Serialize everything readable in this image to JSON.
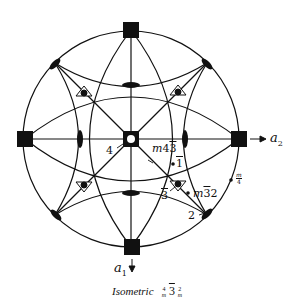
{
  "diagram": {
    "type": "stereographic-projection",
    "projection_circle": {
      "cx": 131,
      "cy": 139,
      "r": 108
    },
    "colors": {
      "ink": "#111111",
      "background": "#ffffff"
    },
    "axes": {
      "a1": {
        "label": "a",
        "subscript": "1",
        "direction": "down"
      },
      "a2": {
        "label": "a",
        "subscript": "2",
        "direction": "right"
      }
    },
    "symmetry_elements": {
      "fourfold_axes": [
        {
          "x": 131,
          "y": 30,
          "position": "top"
        },
        {
          "x": 25,
          "y": 139,
          "position": "left"
        },
        {
          "x": 239,
          "y": 139,
          "position": "right"
        },
        {
          "x": 132,
          "y": 247,
          "position": "bottom"
        }
      ],
      "fourfold_inversion_center": {
        "x": 131,
        "y": 139
      },
      "threefold_axes": [
        {
          "x": 84,
          "y": 92
        },
        {
          "x": 178,
          "y": 91
        },
        {
          "x": 84,
          "y": 186
        },
        {
          "x": 178,
          "y": 185
        }
      ],
      "twofold_axes_rim": [
        {
          "x": 55,
          "y": 63,
          "angle": -45
        },
        {
          "x": 207,
          "y": 63,
          "angle": 45
        },
        {
          "x": 55,
          "y": 215,
          "angle": 45
        },
        {
          "x": 207,
          "y": 215,
          "angle": -45
        }
      ],
      "twofold_axes_inner": [
        {
          "x": 131,
          "y": 85,
          "orient": "horizontal"
        },
        {
          "x": 131,
          "y": 193,
          "orient": "horizontal"
        },
        {
          "x": 80,
          "y": 139,
          "orient": "vertical"
        },
        {
          "x": 185,
          "y": 139,
          "orient": "vertical"
        }
      ]
    },
    "labels": {
      "four": "4",
      "m43": {
        "m": "m",
        "n": "4",
        "bar_n": "3"
      },
      "one_bar": "1",
      "three_bar": "3",
      "m32": {
        "m": "m",
        "bar_n": "3",
        "n": "2"
      },
      "two": "2",
      "m_over_4": {
        "top": "m",
        "bottom": "4"
      }
    },
    "caption": {
      "text": "Isometric",
      "symbol": {
        "a_top": "4",
        "a_bot": "m",
        "b": "3",
        "c_top": "2",
        "c_bot": "m"
      }
    }
  }
}
